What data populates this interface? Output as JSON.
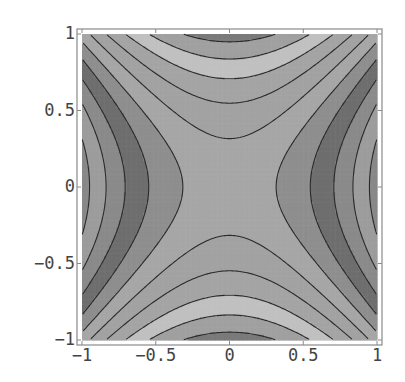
{
  "chart_data": {
    "type": "contour",
    "title": "",
    "xlabel": "",
    "ylabel": "",
    "function": "x^2 - y^2",
    "xlim": [
      -1,
      1
    ],
    "ylim": [
      -1,
      1
    ],
    "grid": false,
    "legend": null,
    "x_ticks": [
      {
        "value": -1,
        "label": "-1"
      },
      {
        "value": -0.5,
        "label": "-0.5"
      },
      {
        "value": 0,
        "label": "0"
      },
      {
        "value": 0.5,
        "label": "0.5"
      },
      {
        "value": 1,
        "label": "1"
      }
    ],
    "y_ticks": [
      {
        "value": 1,
        "label": "1"
      },
      {
        "value": 0.5,
        "label": "0.5"
      },
      {
        "value": 0,
        "label": "0"
      },
      {
        "value": -0.5,
        "label": "-0.5"
      },
      {
        "value": -1,
        "label": "-1"
      }
    ],
    "contour_levels": [
      -0.9,
      -0.7,
      -0.5,
      -0.3,
      -0.1,
      0.1,
      0.3,
      0.5,
      0.7,
      0.9
    ],
    "band_colors": [
      "#7a7a7a",
      "#a0a0a0",
      "#c0c0c0",
      "#a4a4a4",
      "#a2a2a2",
      "#a6a6a6",
      "#8e8e8e",
      "#6e6e6e",
      "#8a8a8a",
      "#9c9c9c",
      "#888888"
    ],
    "contour_line_color": "#2a2a2a",
    "frame_color": "#8a8a8a"
  },
  "layout": {
    "plot_left": 82,
    "plot_top": 34,
    "plot_right": 377,
    "plot_bottom": 340,
    "frame_left": 77,
    "frame_top": 29,
    "frame_right": 382,
    "frame_bottom": 345
  }
}
